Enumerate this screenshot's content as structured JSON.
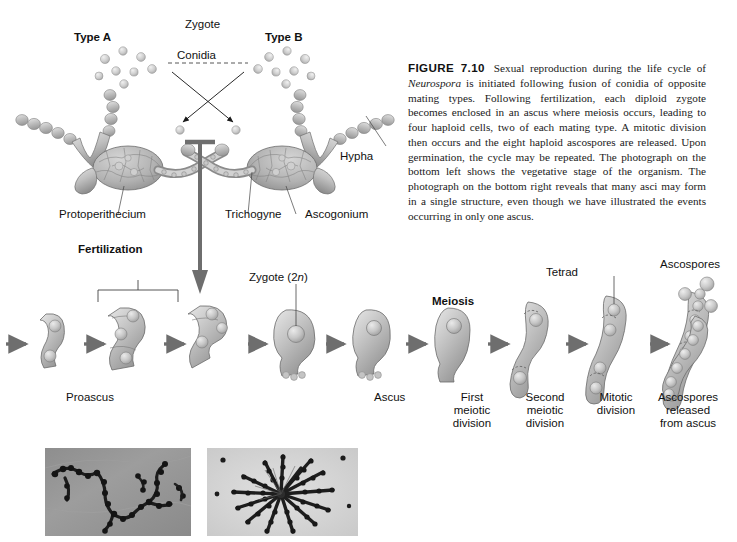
{
  "figure": {
    "number": "FIGURE 7.10",
    "caption": "Sexual reproduction during the life cycle of Neurospora is initiated following fusion of conidia of opposite mating types. Following fertilization, each diploid zygote becomes enclosed in an ascus where meiosis occurs, leading to four haploid cells, two of each mating type. A mitotic division then occurs and the eight haploid ascospores are released. Upon germination, the cycle may be repeated. The photograph on the bottom left shows the vegetative stage of the organism. The photograph on the bottom right reveals that many asci may form in a single structure, even though we have illustrated the events occurring in only one ascus.",
    "caption_italic_term": "Neurospora"
  },
  "top_diagram": {
    "type_a": "Type A",
    "type_b": "Type B",
    "zygote": "Zygote",
    "conidia": "Conidia",
    "protoperithecium": "Protoperithecium",
    "trichogyne": "Trichogyne",
    "ascogonium": "Ascogonium",
    "hypha": "Hypha",
    "fertilization": "Fertilization"
  },
  "cycle_diagram": {
    "zygote_2n_prefix": "Zygote (2",
    "zygote_2n_italic": "n",
    "zygote_2n_suffix": ")",
    "meiosis": "Meiosis",
    "tetrad": "Tetrad",
    "ascospores": "Ascospores",
    "proascus": "Proascus",
    "ascus": "Ascus",
    "stages": [
      {
        "line1": "First",
        "line2": "meiotic",
        "line3": "division"
      },
      {
        "line1": "Second",
        "line2": "meiotic",
        "line3": "division"
      },
      {
        "line1": "Mitotic",
        "line2": "division",
        "line3": ""
      },
      {
        "line1": "Ascospores",
        "line2": "released",
        "line3": "from ascus"
      }
    ]
  },
  "photographs": {
    "left_alt": "vegetative-stage-micrograph",
    "right_alt": "asci-cluster-micrograph"
  },
  "colors": {
    "cell_light": "#d9d9d9",
    "cell_mid": "#b4b4b4",
    "cell_dark": "#8f8f8f",
    "outline": "#5a5a5a",
    "arrow": "#6e6e6e",
    "text": "#111111",
    "photo_bg_left": "#9a9a9a",
    "photo_bg_right": "#d2d2d2"
  }
}
